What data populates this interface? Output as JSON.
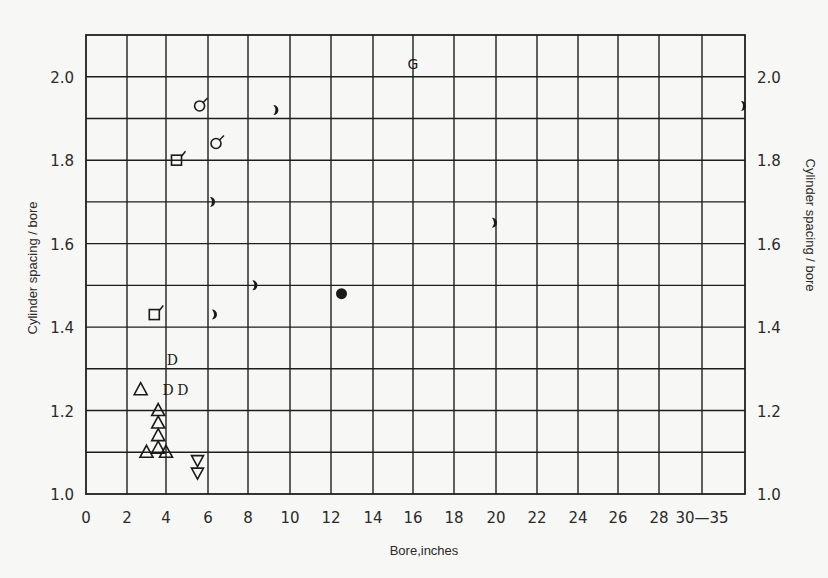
{
  "chart_data": {
    "type": "scatter",
    "title": "",
    "xlabel": "Bore,inches",
    "ylabel": "Cylinder spacing / bore",
    "ylabel_right": "Cylinder spacing / bore",
    "xlim": [
      0,
      35
    ],
    "ylim": [
      1.0,
      2.1
    ],
    "grid": true,
    "legend": "none",
    "x_ticks": [
      "0",
      "2",
      "4",
      "6",
      "8",
      "10",
      "12",
      "14",
      "16",
      "18",
      "20",
      "22",
      "24",
      "26",
      "28",
      "30—35"
    ],
    "y_ticks": [
      "1.0",
      "1.2",
      "1.4",
      "1.6",
      "1.8",
      "2.0"
    ],
    "y_ticks_right": [
      "1.0",
      "1.2",
      "1.4",
      "1.6",
      "1.8",
      "2.0"
    ],
    "series": [
      {
        "name": "open-circle-flagged",
        "marker": "circle-open-flag",
        "points": [
          [
            5.6,
            1.93
          ],
          [
            6.4,
            1.84
          ]
        ]
      },
      {
        "name": "open-square-flagged",
        "marker": "square-open-flag",
        "points": [
          [
            4.5,
            1.8
          ],
          [
            3.4,
            1.43
          ]
        ]
      },
      {
        "name": "half-filled-circle",
        "marker": "half-circle",
        "points": [
          [
            9.4,
            1.92
          ],
          [
            6.3,
            1.7
          ],
          [
            20.0,
            1.65
          ],
          [
            8.4,
            1.5
          ],
          [
            6.4,
            1.43
          ],
          [
            35.0,
            1.93
          ]
        ]
      },
      {
        "name": "filled-circle",
        "marker": "circle-filled",
        "points": [
          [
            12.5,
            1.48
          ]
        ]
      },
      {
        "name": "G",
        "marker": "letter-G",
        "points": [
          [
            16.0,
            2.03
          ]
        ]
      },
      {
        "name": "D",
        "marker": "letter-D",
        "points": [
          [
            4.3,
            1.32
          ],
          [
            4.1,
            1.25
          ],
          [
            4.8,
            1.25
          ]
        ]
      },
      {
        "name": "open-triangle-up",
        "marker": "triangle-up-open",
        "points": [
          [
            2.7,
            1.25
          ],
          [
            3.6,
            1.2
          ],
          [
            3.6,
            1.17
          ],
          [
            3.6,
            1.14
          ],
          [
            3.6,
            1.11
          ],
          [
            3.0,
            1.1
          ],
          [
            4.0,
            1.1
          ]
        ]
      },
      {
        "name": "open-triangle-down",
        "marker": "triangle-down-open",
        "points": [
          [
            5.5,
            1.08
          ],
          [
            5.5,
            1.05
          ]
        ]
      }
    ]
  }
}
